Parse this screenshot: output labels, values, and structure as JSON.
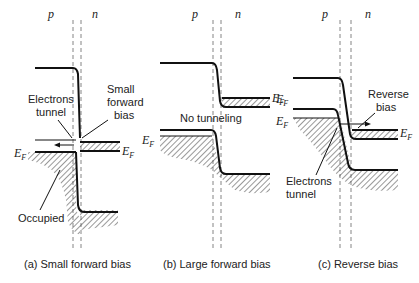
{
  "panels": [
    {
      "id": "a",
      "caption": "(a) Small forward bias",
      "region_labels": {
        "p": "p",
        "n": "n"
      },
      "fermi_label_left": {
        "main": "E",
        "sub": "F"
      },
      "fermi_label_right": {
        "main": "E",
        "sub": "F"
      },
      "annotations": {
        "electrons_tunnel_line1": "Electrons",
        "electrons_tunnel_line2": "tunnel",
        "small_line1": "Small",
        "small_line2": "forward",
        "small_line3": "bias",
        "occupied": "Occupied"
      }
    },
    {
      "id": "b",
      "caption": "(b) Large forward bias",
      "region_labels": {
        "p": "p",
        "n": "n"
      },
      "fermi_label_left": {
        "main": "E",
        "sub": "F"
      },
      "fermi_label_right": {
        "main": "E",
        "sub": "F"
      },
      "annotations": {
        "no_tunneling": "No tunneling"
      }
    },
    {
      "id": "c",
      "caption": "(c) Reverse bias",
      "region_labels": {
        "p": "p",
        "n": "n"
      },
      "fermi_label_left": {
        "main": "E",
        "sub": "F"
      },
      "fermi_label_right": {
        "main": "E",
        "sub": "F"
      },
      "annotations": {
        "reverse_line1": "Reverse",
        "reverse_line2": "bias",
        "electrons_tunnel_line1": "Electrons",
        "electrons_tunnel_line2": "tunnel"
      }
    }
  ]
}
